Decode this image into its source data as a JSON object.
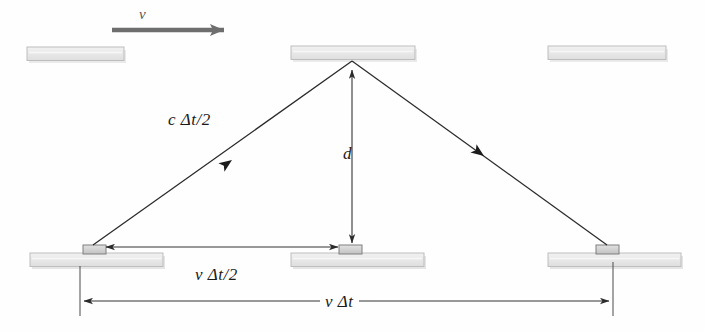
{
  "figure": {
    "background_color": "#fefefe"
  },
  "labels": {
    "velocity": "v",
    "light_path": "c Δt/2",
    "mirror_separation": "d",
    "half_displacement": "v Δt/2",
    "total_displacement": "v Δt"
  },
  "colors": {
    "mirror_fill": "#ececec",
    "mirror_stroke": "#b4b4b4",
    "mirror_shadow": "#d6d6d6",
    "ray_stroke": "#2a2a2a",
    "dimension_stroke": "#333333",
    "velocity_arrow": "#6e6e6e",
    "box_fill": "#cfcfcf",
    "box_stroke": "#8a8a8a"
  },
  "elements": {
    "velocity_arrow": {
      "name": "velocity-arrow",
      "x1": 112,
      "y1": 30,
      "x2": 230,
      "y2": 30
    },
    "top_mirrors": [
      {
        "name": "top-mirror-left",
        "x": 27,
        "y": 47,
        "width": 97,
        "height": 14
      },
      {
        "name": "top-mirror-middle",
        "x": 291,
        "y": 46,
        "width": 124,
        "height": 14
      },
      {
        "name": "top-mirror-right",
        "x": 548,
        "y": 46,
        "width": 118,
        "height": 14
      }
    ],
    "bottom_mirrors": [
      {
        "name": "bottom-mirror-left",
        "x": 30,
        "y": 253,
        "width": 133,
        "height": 14
      },
      {
        "name": "bottom-mirror-middle",
        "x": 291,
        "y": 253,
        "width": 133,
        "height": 14
      },
      {
        "name": "bottom-mirror-right",
        "x": 548,
        "y": 253,
        "width": 133,
        "height": 14
      }
    ],
    "source_boxes": [
      {
        "name": "light-source-box",
        "x": 83,
        "y": 245,
        "width": 22,
        "height": 9
      },
      {
        "name": "light-midpoint-box",
        "x": 339,
        "y": 245,
        "width": 22,
        "height": 9
      },
      {
        "name": "light-detector-box",
        "x": 596,
        "y": 245,
        "width": 22,
        "height": 9
      }
    ],
    "rays": [
      {
        "name": "ray-upward",
        "x1": 93,
        "y1": 246,
        "x2": 352,
        "y2": 62,
        "arrow_at": 0.52
      },
      {
        "name": "ray-downward",
        "x1": 352,
        "y1": 62,
        "x2": 607,
        "y2": 246,
        "arrow_at": 0.5
      }
    ],
    "dimension_d": {
      "name": "dimension-d",
      "x": 352,
      "y1": 62,
      "y2": 250
    },
    "dimension_vdt2": {
      "name": "dimension-v-delta-t-half",
      "y": 247,
      "x1": 100,
      "x2": 345
    },
    "dimension_vdt": {
      "name": "dimension-v-delta-t",
      "y": 301,
      "x1": 80,
      "x2": 613
    },
    "extension_lines": [
      {
        "name": "extension-line-left",
        "x": 80,
        "y1": 266,
        "y2": 316
      },
      {
        "name": "extension-line-right",
        "x": 613,
        "y1": 262,
        "y2": 316
      }
    ]
  }
}
